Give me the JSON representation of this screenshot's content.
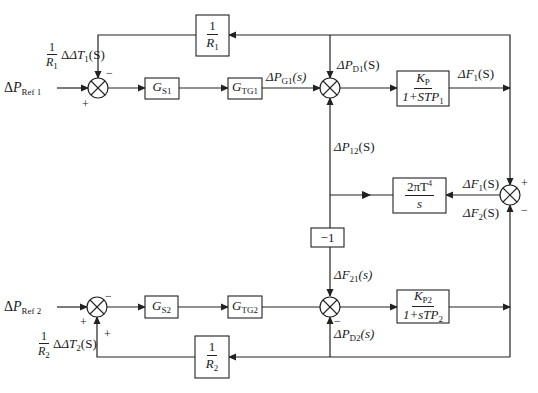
{
  "diagram": {
    "type": "two-area load frequency control block diagram",
    "area1": {
      "input": {
        "delta": "Δ",
        "var": "P",
        "sub": "Ref 1"
      },
      "feedback_label": {
        "num": "1",
        "den_var": "R",
        "den_sub": "1",
        "rest_pre": "ΔT",
        "rest_sub": "1",
        "rest_post": "(S)"
      },
      "sum1_signs": {
        "top": "−",
        "left": "+"
      },
      "gs": {
        "var": "G",
        "sub": "S1"
      },
      "gtg": {
        "var": "G",
        "sub": "TG1"
      },
      "pg_label": {
        "pre": "ΔP",
        "sub": "G1",
        "post": "(s)"
      },
      "pd_label": {
        "pre": "ΔP",
        "sub": "D1",
        "post": "(S)"
      },
      "kp_block": {
        "num_var": "K",
        "num_sub": "P",
        "den_pre": "1+ST",
        "den_var": "P",
        "den_sub": "1"
      },
      "f_label": {
        "pre": "ΔF",
        "sub": "1",
        "post": "(S)"
      },
      "r_block": {
        "num": "1",
        "den_var": "R",
        "den_sub": "1"
      }
    },
    "tie": {
      "p12_label": {
        "pre": "ΔP",
        "sub": "12",
        "post": "(S)"
      },
      "tie_block": {
        "num": "2πT",
        "num_sup": "4",
        "den": "s"
      },
      "neg_block": "−1",
      "f21_label": {
        "pre": "ΔF",
        "sub": "21",
        "post": "(s)"
      },
      "sum_right_labels": {
        "top": {
          "pre": "ΔF",
          "sub": "1",
          "post": "(S)"
        },
        "bottom": {
          "pre": "ΔF",
          "sub": "2",
          "post": "(S)"
        }
      },
      "sum_right_signs": {
        "top": "+",
        "bottom": "−"
      }
    },
    "area2": {
      "input": {
        "delta": "Δ",
        "var": "P",
        "sub": "Ref 2"
      },
      "feedback_label": {
        "num": "1",
        "den_var": "R",
        "den_sub": "2",
        "rest_pre": "ΔT",
        "rest_sub": "2",
        "rest_post": "(S)"
      },
      "sum3_signs": {
        "top": "−",
        "left": "+",
        "bottom": "+"
      },
      "gs": {
        "var": "G",
        "sub": "S2"
      },
      "gtg": {
        "var": "G",
        "sub": "TG2"
      },
      "pd_label": {
        "pre": "ΔP",
        "sub": "D2",
        "post": "(s)",
        "sign": "−"
      },
      "kp_block": {
        "num_var": "K",
        "num_sub": "P2",
        "den_pre": "1+sT",
        "den_var": "P",
        "den_sub": "2"
      },
      "r_block": {
        "num": "1",
        "den_var": "R",
        "den_sub": "2"
      }
    }
  }
}
